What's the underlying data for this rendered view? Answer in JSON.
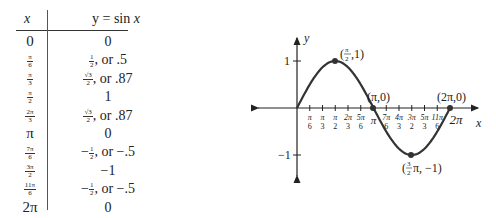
{
  "table": {
    "header": {
      "x": "x",
      "y_prefix": "y = sin ",
      "y_var": "x"
    },
    "rows": [
      {
        "x": "0",
        "y": "0"
      },
      {
        "x_num": "π",
        "x_den": "6",
        "y_num": "1",
        "y_den": "2",
        "y_suffix": ", or .5"
      },
      {
        "x_num": "π",
        "x_den": "3",
        "y_num": "√3",
        "y_den": "2",
        "y_suffix": ", or .87"
      },
      {
        "x_num": "π",
        "x_den": "2",
        "y": "1"
      },
      {
        "x_num": "2π",
        "x_den": "3",
        "y_num": "√3",
        "y_den": "2",
        "y_suffix": ", or .87"
      },
      {
        "x": "π",
        "y": "0"
      },
      {
        "x_num": "7π",
        "x_den": "6",
        "y_prefix": "−",
        "y_num": "1",
        "y_den": "2",
        "y_suffix": ", or −.5"
      },
      {
        "x_num": "3π",
        "x_den": "2",
        "y": "−1"
      },
      {
        "x_num": "11π",
        "x_den": "6",
        "y_prefix": "−",
        "y_num": "1",
        "y_den": "2",
        "y_suffix": ", or −.5"
      },
      {
        "x": "2π",
        "y": "0"
      }
    ]
  },
  "chart_data": {
    "type": "line",
    "title": "",
    "function": "y = sin x",
    "xlabel": "x",
    "ylabel": "y",
    "x": [
      0,
      0.5236,
      1.0472,
      1.5708,
      2.0944,
      2.618,
      3.1416,
      3.6652,
      4.1888,
      4.7124,
      5.236,
      5.7596,
      6.2832
    ],
    "values": [
      0,
      0.5,
      0.87,
      1,
      0.87,
      0.5,
      0,
      -0.5,
      -0.87,
      -1,
      -0.87,
      -0.5,
      0
    ],
    "x_tick_labels": [
      "π/6",
      "π/3",
      "π/2",
      "2π/3",
      "5π/6",
      "π",
      "7π/6",
      "4π/3",
      "3π/2",
      "5π/3",
      "11π/6",
      "2π"
    ],
    "y_tick_labels": [
      "1",
      "−1"
    ],
    "annotations": [
      "(π/2,1)",
      "(π,0)",
      "(3/2π,−1)",
      "(2π,0)"
    ],
    "xlim": [
      0,
      6.2832
    ],
    "ylim": [
      -1,
      1
    ],
    "grid": false,
    "legend": "none"
  },
  "labels": {
    "y_axis": "y",
    "x_axis": "x",
    "one": "1",
    "neg_one": "−1",
    "peak": "(π/2,1)",
    "pi_point": "(π,0)",
    "two_pi_point": "(2π,0)",
    "trough": "(3/2π,−1)"
  }
}
